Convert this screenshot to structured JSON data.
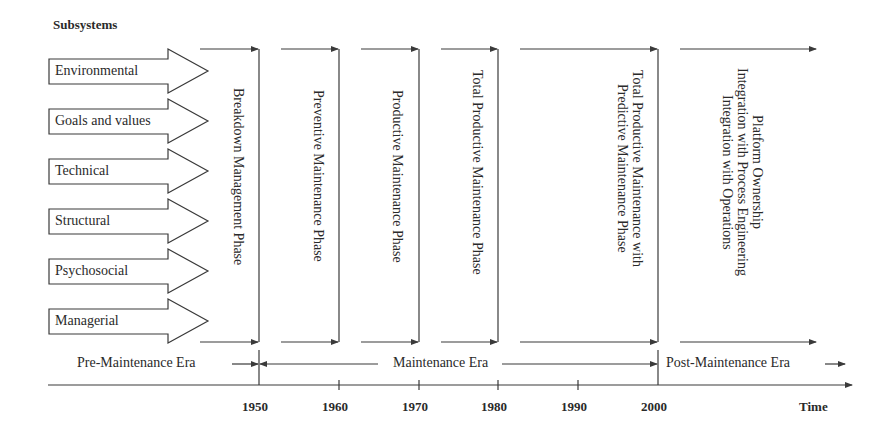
{
  "title": "Subsystems",
  "subsystems": [
    {
      "label": "Environmental"
    },
    {
      "label": "Goals and values"
    },
    {
      "label": "Technical"
    },
    {
      "label": "Structural"
    },
    {
      "label": "Psychosocial"
    },
    {
      "label": "Managerial"
    }
  ],
  "phases": [
    {
      "lines": [
        "Breakdown Management Phase"
      ]
    },
    {
      "lines": [
        "Preventive Maintenance Phase"
      ]
    },
    {
      "lines": [
        "Productive Maintenance Phase"
      ]
    },
    {
      "lines": [
        "Total Productive Maintenance Phase"
      ]
    },
    {
      "lines": [
        "Total Productive Maintenance with",
        "Predictive Maintenance Phase"
      ]
    },
    {
      "lines": [
        "Platform Ownership",
        "Integration with Process Engineering",
        "Integration with Operations"
      ]
    }
  ],
  "eras": [
    {
      "label": "Pre-Maintenance Era"
    },
    {
      "label": "Maintenance Era"
    },
    {
      "label": "Post-Maintenance Era"
    }
  ],
  "axis": {
    "ticks": [
      "1950",
      "1960",
      "1970",
      "1980",
      "1990",
      "2000"
    ],
    "label": "Time"
  },
  "colors": {
    "line": "#3a3a3a",
    "text": "#2a2a2a",
    "background": "#ffffff"
  }
}
